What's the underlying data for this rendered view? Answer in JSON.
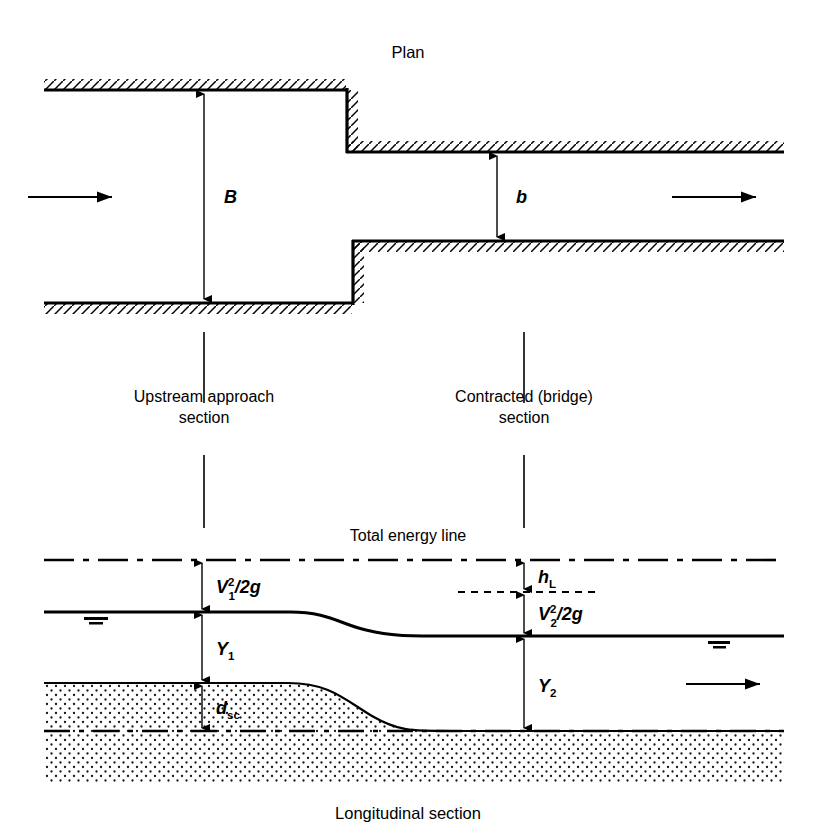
{
  "figure": {
    "plan_title": "Plan",
    "bottom_caption": "Longitudinal section"
  },
  "plan": {
    "width_label_B": "B",
    "width_label_b": "b",
    "inflow_arrow": "flow-arrow-left",
    "outflow_arrow": "flow-arrow-right"
  },
  "sections": {
    "upstream": {
      "line1": "Upstream approach",
      "line2": "section"
    },
    "contracted": {
      "line1": "Contracted (bridge)",
      "line2": "section"
    }
  },
  "longitudinal": {
    "energy_line_label": "Total energy line",
    "velocity_head_1": {
      "base": "V",
      "sup": "2",
      "sub": "1",
      "tail": "/2g"
    },
    "velocity_head_2": {
      "base": "V",
      "sup": "2",
      "sub": "2",
      "tail": "/2g"
    },
    "head_loss": {
      "base": "h",
      "sub": "L"
    },
    "depth_1": {
      "base": "Y",
      "sub": "1"
    },
    "depth_2": {
      "base": "Y",
      "sub": "2"
    },
    "scour_depth": {
      "base": "d",
      "sub": "sc"
    },
    "flow_arrow": "flow-arrow-right"
  },
  "colors": {
    "ink": "#000000",
    "background": "#ffffff",
    "sediment_stipple": "#1a1a1a"
  }
}
